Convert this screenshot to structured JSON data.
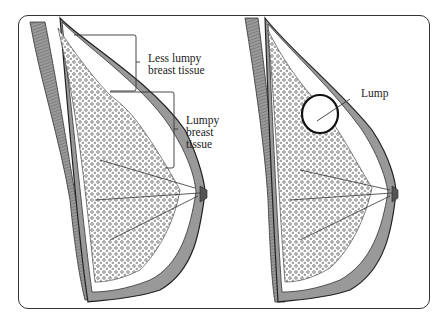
{
  "figure": {
    "left_panel": {
      "label_upper": [
        "Less lumpy",
        "breast tissue"
      ],
      "label_lower": [
        "Lumpy",
        "breast",
        "tissue"
      ]
    },
    "right_panel": {
      "label_lump": "Lump"
    }
  },
  "colors": {
    "line": "#2a2a2a",
    "fill_tissue": "#8a8a8a",
    "background": "#ffffff"
  }
}
